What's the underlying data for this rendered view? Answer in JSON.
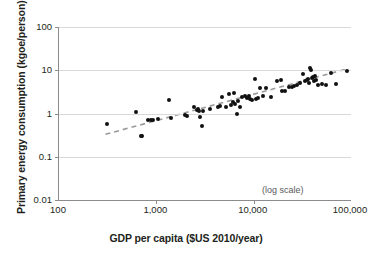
{
  "chart_data": {
    "type": "scatter",
    "title": "",
    "xlabel": "GDP per capita ($US 2010/year)",
    "ylabel": "Primary energy consumption (kgoe/person)",
    "annotation": "(log scale)",
    "xscale": "log",
    "yscale": "log",
    "xlim": [
      100,
      100000
    ],
    "ylim": [
      0.01,
      100
    ],
    "grid": true,
    "legend": false,
    "xticks": [
      100,
      1000,
      10000,
      100000
    ],
    "xticklabels": [
      "100",
      "1,000",
      "10,000",
      "100,000"
    ],
    "yticks": [
      0.01,
      0.1,
      1,
      10,
      100
    ],
    "yticklabels": [
      "0.01",
      "0.1",
      "1",
      "10",
      "100"
    ],
    "marker_color": "#111111",
    "grid_color": "#d9d9d9",
    "axis_color": "#8c8c8c",
    "trendline": {
      "style": "dashed",
      "color": "#9a9a9a",
      "x": [
        300,
        95000
      ],
      "y": [
        0.33,
        11.0
      ]
    },
    "points": [
      {
        "x": 310,
        "y": 0.58
      },
      {
        "x": 620,
        "y": 1.07
      },
      {
        "x": 700,
        "y": 0.3
      },
      {
        "x": 710,
        "y": 0.295
      },
      {
        "x": 830,
        "y": 0.72
      },
      {
        "x": 880,
        "y": 0.7
      },
      {
        "x": 930,
        "y": 0.71
      },
      {
        "x": 1050,
        "y": 0.76
      },
      {
        "x": 1350,
        "y": 2.05
      },
      {
        "x": 1400,
        "y": 0.78
      },
      {
        "x": 1950,
        "y": 0.92
      },
      {
        "x": 2050,
        "y": 0.88
      },
      {
        "x": 2450,
        "y": 1.45
      },
      {
        "x": 2600,
        "y": 1.18
      },
      {
        "x": 2700,
        "y": 1.25
      },
      {
        "x": 2750,
        "y": 1.12
      },
      {
        "x": 2800,
        "y": 0.83
      },
      {
        "x": 2950,
        "y": 0.52
      },
      {
        "x": 3000,
        "y": 1.15
      },
      {
        "x": 3600,
        "y": 1.3
      },
      {
        "x": 4300,
        "y": 1.45
      },
      {
        "x": 4500,
        "y": 1.52
      },
      {
        "x": 4700,
        "y": 2.35
      },
      {
        "x": 5200,
        "y": 1.38
      },
      {
        "x": 5600,
        "y": 2.9
      },
      {
        "x": 5900,
        "y": 1.6
      },
      {
        "x": 6100,
        "y": 1.85
      },
      {
        "x": 6300,
        "y": 3.05
      },
      {
        "x": 6500,
        "y": 1.7
      },
      {
        "x": 6700,
        "y": 1.0
      },
      {
        "x": 6900,
        "y": 1.95
      },
      {
        "x": 7200,
        "y": 1.45
      },
      {
        "x": 7600,
        "y": 2.45
      },
      {
        "x": 8200,
        "y": 2.55
      },
      {
        "x": 8600,
        "y": 2.3
      },
      {
        "x": 8900,
        "y": 2.6
      },
      {
        "x": 9200,
        "y": 2.2
      },
      {
        "x": 9600,
        "y": 2.1
      },
      {
        "x": 10200,
        "y": 6.4
      },
      {
        "x": 10500,
        "y": 2.15
      },
      {
        "x": 11000,
        "y": 2.25
      },
      {
        "x": 11500,
        "y": 3.9
      },
      {
        "x": 12500,
        "y": 2.55
      },
      {
        "x": 13500,
        "y": 3.8
      },
      {
        "x": 15000,
        "y": 2.35
      },
      {
        "x": 17500,
        "y": 5.7
      },
      {
        "x": 19000,
        "y": 6.05
      },
      {
        "x": 19500,
        "y": 3.3
      },
      {
        "x": 21000,
        "y": 3.3
      },
      {
        "x": 23000,
        "y": 4.0
      },
      {
        "x": 25000,
        "y": 4.1
      },
      {
        "x": 26000,
        "y": 4.3
      },
      {
        "x": 28000,
        "y": 4.5
      },
      {
        "x": 30000,
        "y": 5.2
      },
      {
        "x": 32000,
        "y": 8.3
      },
      {
        "x": 34000,
        "y": 5.6
      },
      {
        "x": 35000,
        "y": 5.9
      },
      {
        "x": 36000,
        "y": 6.3
      },
      {
        "x": 37000,
        "y": 5.1
      },
      {
        "x": 38000,
        "y": 11.0
      },
      {
        "x": 39000,
        "y": 10.2
      },
      {
        "x": 40000,
        "y": 6.6
      },
      {
        "x": 41000,
        "y": 6.9
      },
      {
        "x": 42000,
        "y": 5.5
      },
      {
        "x": 43000,
        "y": 7.4
      },
      {
        "x": 44000,
        "y": 6.1
      },
      {
        "x": 46000,
        "y": 4.6
      },
      {
        "x": 50000,
        "y": 4.8
      },
      {
        "x": 55000,
        "y": 4.6
      },
      {
        "x": 62000,
        "y": 8.7
      },
      {
        "x": 70000,
        "y": 4.8
      },
      {
        "x": 90000,
        "y": 9.6
      }
    ]
  }
}
